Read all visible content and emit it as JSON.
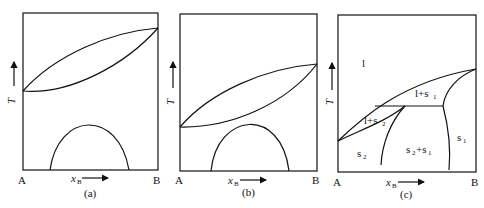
{
  "figure": {
    "panels": [
      {
        "id": "a",
        "caption": "(a)",
        "left_label": "A",
        "right_label": "B",
        "x_axis_label": "x",
        "x_axis_subscript": "B",
        "y_axis_label": "T",
        "regions": []
      },
      {
        "id": "b",
        "caption": "(b)",
        "left_label": "A",
        "right_label": "B",
        "x_axis_label": "x",
        "x_axis_subscript": "B",
        "y_axis_label": "T",
        "regions": []
      },
      {
        "id": "c",
        "caption": "(c)",
        "left_label": "A",
        "right_label": "B",
        "x_axis_label": "x",
        "x_axis_subscript": "B",
        "y_axis_label": "T",
        "regions": {
          "liquid": "l",
          "liquid_s1": "l+s",
          "liquid_s1_sub": "1",
          "liquid_s2": "l+s",
          "liquid_s2_sub": "2",
          "s2": "s",
          "s2_sub": "2",
          "s2_s1_a": "s",
          "s2_s1_a_sub": "2",
          "s2_s1_plus": "+s",
          "s2_s1_b_sub": "1",
          "s1": "s",
          "s1_sub": "1"
        }
      }
    ]
  }
}
